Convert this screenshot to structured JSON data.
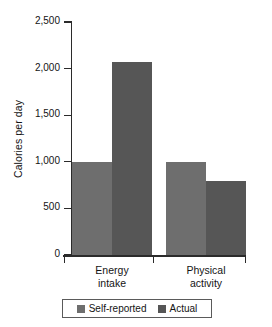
{
  "chart_data": {
    "type": "bar",
    "title": "",
    "subtitle": "",
    "xlabel": "",
    "ylabel": "Calories per day",
    "categories": [
      "Energy intake",
      "Physical activity"
    ],
    "category_lines": [
      [
        "Energy",
        "intake"
      ],
      [
        "Physical",
        "activity"
      ]
    ],
    "series": [
      {
        "name": "Self-reported",
        "color": "#6e6e6e",
        "values": [
          1000,
          1000
        ]
      },
      {
        "name": "Actual",
        "color": "#565656",
        "values": [
          2070,
          790
        ]
      }
    ],
    "ylim": [
      0,
      2500
    ],
    "yticks": [
      0,
      500,
      1000,
      1500,
      2000,
      2500
    ],
    "ytick_labels": [
      "0",
      "500",
      "1,000",
      "1,500",
      "2,000",
      "2,500"
    ],
    "grid": false,
    "legend_position": "bottom",
    "legend_entries": [
      "Self-reported",
      "Actual"
    ],
    "background_color": "#ffffff",
    "axis_color": "#2b2b2b"
  }
}
